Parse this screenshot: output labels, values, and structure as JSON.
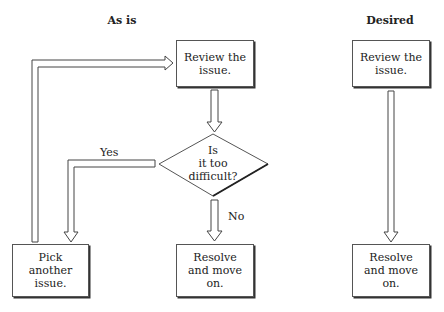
{
  "titles": {
    "as_is": "As is",
    "desired": "Desired"
  },
  "as_is": {
    "review": "Review the\nissue.",
    "decision": "Is\nit too\ndifficult?",
    "yes_label": "Yes",
    "no_label": "No",
    "pick": "Pick\nanother\nissue.",
    "resolve": "Resolve\nand move\non."
  },
  "desired": {
    "review": "Review the\nissue.",
    "resolve": "Resolve\nand move\non."
  }
}
